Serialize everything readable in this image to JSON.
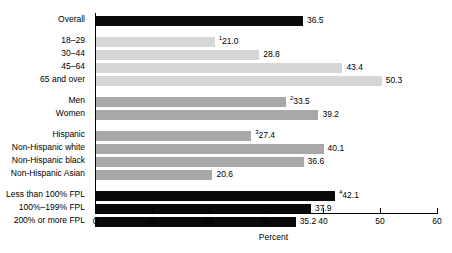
{
  "chart_data": {
    "type": "bar",
    "orientation": "horizontal",
    "title": "",
    "xlabel": "Percent",
    "ylabel": "",
    "xlim": [
      0,
      60
    ],
    "xticks": [
      0,
      10,
      20,
      30,
      40,
      50,
      60
    ],
    "xtick_labels": [
      "0",
      "10",
      "20",
      "30",
      "40",
      "50",
      "60"
    ],
    "grid": false,
    "legend": "none",
    "categories": [
      "Overall",
      "18–29",
      "30–44",
      "45–64",
      "65 and over",
      "Men",
      "Women",
      "Hispanic",
      "Non-Hispanic white",
      "Non-Hispanic black",
      "Non-Hispanic Asian",
      "Less than 100% FPL",
      "100%–199% FPL",
      "200% or more FPL"
    ],
    "values": [
      36.5,
      21.0,
      28.8,
      43.4,
      50.3,
      33.5,
      39.2,
      27.4,
      40.1,
      36.6,
      20.6,
      42.1,
      37.9,
      35.2
    ],
    "value_labels": [
      "36.5",
      "21.0",
      "28.8",
      "43.4",
      "50.3",
      "33.5",
      "39.2",
      "27.4",
      "40.1",
      "36.6",
      "20.6",
      "42.1",
      "37.9",
      "35.2"
    ],
    "footnote_markers": [
      "",
      "1",
      "",
      "",
      "",
      "2",
      "",
      "3",
      "",
      "",
      "",
      "4",
      "",
      ""
    ],
    "colors": {
      "overall": "#0a0a0a",
      "age": "#d6d6d6",
      "sex": "#a8a8a8",
      "race": "#a8a8a8",
      "fpl": "#0a0a0a",
      "axis": "#000000",
      "background": "#ffffff"
    },
    "bars": [
      {
        "label": "Overall",
        "value": 36.5,
        "value_label": "36.5",
        "marker": "",
        "group": "overall",
        "color": "#0a0a0a",
        "top": 16
      },
      {
        "label": "18–29",
        "value": 21.0,
        "value_label": "21.0",
        "marker": "1",
        "group": "age",
        "color": "#d6d6d6",
        "top": 37
      },
      {
        "label": "30–44",
        "value": 28.8,
        "value_label": "28.8",
        "marker": "",
        "group": "age",
        "color": "#d6d6d6",
        "top": 50
      },
      {
        "label": "45–64",
        "value": 43.4,
        "value_label": "43.4",
        "marker": "",
        "group": "age",
        "color": "#d6d6d6",
        "top": 63
      },
      {
        "label": "65 and over",
        "value": 50.3,
        "value_label": "50.3",
        "marker": "",
        "group": "age",
        "color": "#d6d6d6",
        "top": 76
      },
      {
        "label": "Men",
        "value": 33.5,
        "value_label": "33.5",
        "marker": "2",
        "group": "sex",
        "color": "#a8a8a8",
        "top": 97
      },
      {
        "label": "Women",
        "value": 39.2,
        "value_label": "39.2",
        "marker": "",
        "group": "sex",
        "color": "#a8a8a8",
        "top": 110
      },
      {
        "label": "Hispanic",
        "value": 27.4,
        "value_label": "27.4",
        "marker": "3",
        "group": "race",
        "color": "#a8a8a8",
        "top": 131
      },
      {
        "label": "Non-Hispanic white",
        "value": 40.1,
        "value_label": "40.1",
        "marker": "",
        "group": "race",
        "color": "#a8a8a8",
        "top": 144
      },
      {
        "label": "Non-Hispanic black",
        "value": 36.6,
        "value_label": "36.6",
        "marker": "",
        "group": "race",
        "color": "#a8a8a8",
        "top": 157
      },
      {
        "label": "Non-Hispanic Asian",
        "value": 20.6,
        "value_label": "20.6",
        "marker": "",
        "group": "race",
        "color": "#a8a8a8",
        "top": 170
      },
      {
        "label": "Less than 100% FPL",
        "value": 42.1,
        "value_label": "42.1",
        "marker": "4",
        "group": "fpl",
        "color": "#0a0a0a",
        "top": 191
      },
      {
        "label": "100%–199% FPL",
        "value": 37.9,
        "value_label": "37.9",
        "marker": "",
        "group": "fpl",
        "color": "#0a0a0a",
        "top": 199
      },
      {
        "label": "200% or more FPL",
        "value": 35.2,
        "value_label": "35.2",
        "marker": "",
        "group": "fpl",
        "color": "#0a0a0a",
        "top": 203
      }
    ]
  },
  "axis": {
    "x_title": "Percent",
    "ticks": [
      "0",
      "10",
      "20",
      "30",
      "40",
      "50",
      "60"
    ]
  }
}
